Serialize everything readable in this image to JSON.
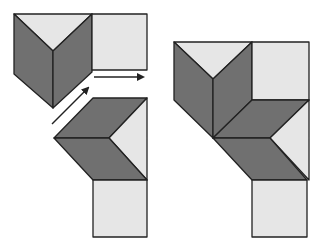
{
  "colors": {
    "background": "#ffffff",
    "light_fill": "#e6e6e6",
    "dark_fill": "#707070",
    "stroke": "#222222",
    "arrow": "#222222"
  },
  "figures": {
    "left": {
      "description": "Two separate pieces before assembly, with arrows indicating sliding motion",
      "upper_piece": {
        "light_triangle": [
          [
            14,
            14
          ],
          [
            92,
            14
          ],
          [
            53,
            51
          ]
        ],
        "dark_left_face": [
          [
            14,
            14
          ],
          [
            53,
            51
          ],
          [
            53,
            108
          ],
          [
            14,
            74
          ]
        ],
        "dark_right_face": [
          [
            92,
            14
          ],
          [
            53,
            51
          ],
          [
            53,
            108
          ],
          [
            92,
            72
          ]
        ],
        "light_square": [
          [
            92,
            14
          ],
          [
            147,
            14
          ],
          [
            147,
            70
          ],
          [
            92,
            70
          ]
        ]
      },
      "lower_piece": {
        "dark_upper_rhombus": [
          [
            93,
            98
          ],
          [
            147,
            98
          ],
          [
            109,
            138
          ],
          [
            54,
            138
          ]
        ],
        "light_right_triangle": [
          [
            147,
            98
          ],
          [
            147,
            180
          ],
          [
            109,
            138
          ]
        ],
        "dark_lower_rhombus": [
          [
            54,
            138
          ],
          [
            109,
            138
          ],
          [
            147,
            180
          ],
          [
            93,
            180
          ]
        ],
        "light_square": [
          [
            93,
            180
          ],
          [
            147,
            180
          ],
          [
            147,
            237
          ],
          [
            93,
            237
          ]
        ]
      },
      "arrows": [
        {
          "name": "horizontal-arrow",
          "from": [
            94,
            77
          ],
          "to": [
            143,
            77
          ]
        },
        {
          "name": "diagonal-arrow",
          "from": [
            52,
            124
          ],
          "to": [
            88,
            88
          ]
        }
      ]
    },
    "right": {
      "description": "Assembled figure",
      "light_triangle": [
        [
          174,
          42
        ],
        [
          252,
          42
        ],
        [
          213,
          79
        ]
      ],
      "dark_left_face": [
        [
          174,
          42
        ],
        [
          213,
          79
        ],
        [
          213,
          138
        ],
        [
          174,
          100
        ]
      ],
      "dark_right_face": [
        [
          252,
          42
        ],
        [
          213,
          79
        ],
        [
          213,
          138
        ],
        [
          252,
          100
        ]
      ],
      "light_square_top": [
        [
          252,
          42
        ],
        [
          309,
          42
        ],
        [
          309,
          100
        ],
        [
          252,
          100
        ]
      ],
      "dark_upper_rhombus": [
        [
          252,
          100
        ],
        [
          309,
          100
        ],
        [
          270,
          138
        ],
        [
          213,
          138
        ]
      ],
      "light_right_triangle": [
        [
          309,
          100
        ],
        [
          309,
          180
        ],
        [
          270,
          138
        ]
      ],
      "dark_lower_rhombus": [
        [
          213,
          138
        ],
        [
          270,
          138
        ],
        [
          307,
          180
        ],
        [
          252,
          180
        ]
      ],
      "light_square_bottom": [
        [
          252,
          180
        ],
        [
          307,
          180
        ],
        [
          307,
          237
        ],
        [
          252,
          237
        ]
      ]
    }
  }
}
